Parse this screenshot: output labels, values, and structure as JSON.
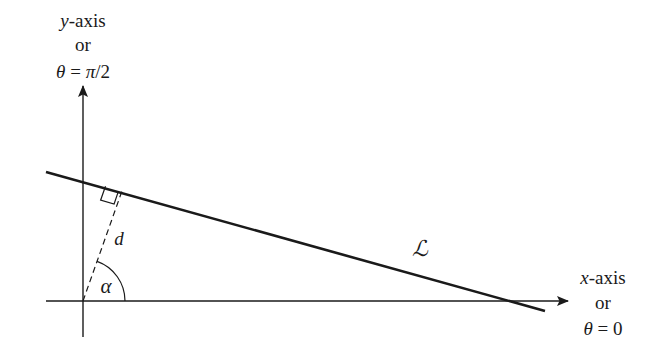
{
  "diagram": {
    "type": "polar-normal-form-of-line",
    "colors": {
      "stroke": "#1a1a1a",
      "background": "#ffffff"
    },
    "y_axis_label": {
      "line1_var": "y",
      "line1_rest": "-axis",
      "line2": "or",
      "line3_theta": "θ",
      "line3_eq": " = ",
      "line3_pi": "π",
      "line3_rest": "/2"
    },
    "x_axis_label": {
      "line1_var": "x",
      "line1_rest": "-axis",
      "line2": "or",
      "line3_theta": "θ",
      "line3_eq": " = ",
      "line3_rest": "0"
    },
    "line_label": "ℒ",
    "distance_label": "d",
    "angle_label": "α",
    "geometry": {
      "origin": [
        83,
        301
      ],
      "y_axis": {
        "top": 84,
        "bottom": 337
      },
      "x_axis": {
        "left": 46,
        "right": 570
      },
      "line_L": {
        "start": [
          46,
          172
        ],
        "end": [
          545,
          311
        ]
      },
      "perpendicular_foot": [
        122,
        191
      ],
      "right_angle_marker": true,
      "angle_arc_radius": 42
    }
  }
}
